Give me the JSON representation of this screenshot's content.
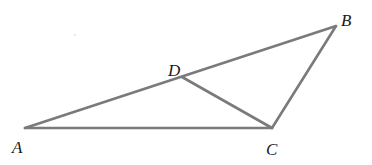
{
  "diagram": {
    "type": "geometry-triangle",
    "stroke_color": "#7a7a7a",
    "stroke_width": 2.6,
    "label_color": "#1a1a1a",
    "points": {
      "A": {
        "x": 25,
        "y": 128
      },
      "B": {
        "x": 336,
        "y": 26
      },
      "C": {
        "x": 272,
        "y": 128
      },
      "D": {
        "x": 182,
        "y": 77
      }
    },
    "segments": [
      {
        "name": "AB",
        "from": "A",
        "to": "B"
      },
      {
        "name": "BC",
        "from": "B",
        "to": "C"
      },
      {
        "name": "CA",
        "from": "C",
        "to": "A"
      },
      {
        "name": "DC",
        "from": "D",
        "to": "C"
      }
    ],
    "labels": [
      {
        "point": "A",
        "text": "A",
        "x": 12,
        "y": 153
      },
      {
        "point": "B",
        "text": "B",
        "x": 341,
        "y": 26
      },
      {
        "point": "C",
        "text": "C",
        "x": 266,
        "y": 155
      },
      {
        "point": "D",
        "text": "D",
        "x": 168,
        "y": 76
      }
    ]
  }
}
